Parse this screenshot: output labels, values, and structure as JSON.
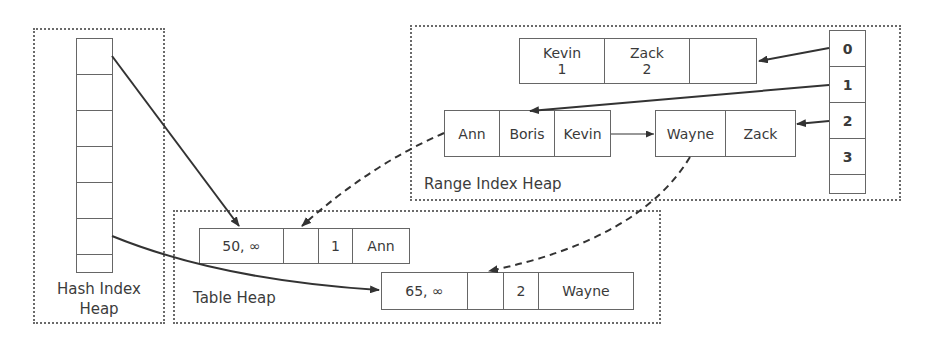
{
  "hash_index_heap": {
    "label_line1": "Hash Index",
    "label_line2": "Heap",
    "bucket_count": 7
  },
  "range_index_heap": {
    "label": "Range Index Heap",
    "mapping_table": [
      "0",
      "1",
      "2",
      "3",
      ""
    ],
    "root_node": {
      "keys": [
        {
          "key": "Kevin",
          "ptr": "1"
        },
        {
          "key": "Zack",
          "ptr": "2"
        },
        {
          "key": "",
          "ptr": ""
        }
      ]
    },
    "leaf_nodes": [
      {
        "keys": [
          "Ann",
          "Boris",
          "Kevin"
        ]
      },
      {
        "keys": [
          "Wayne",
          "Zack"
        ]
      }
    ]
  },
  "table_heap": {
    "label": "Table Heap",
    "rows": [
      {
        "timestamp": "50, ∞",
        "pointer": "",
        "id": "1",
        "name": "Ann"
      },
      {
        "timestamp": "65, ∞",
        "pointer": "",
        "id": "2",
        "name": "Wayne"
      }
    ]
  },
  "colors": {
    "line": "#333333",
    "border": "#666666",
    "dotted": "#6a6a6a",
    "text": "#3a3a3a"
  }
}
